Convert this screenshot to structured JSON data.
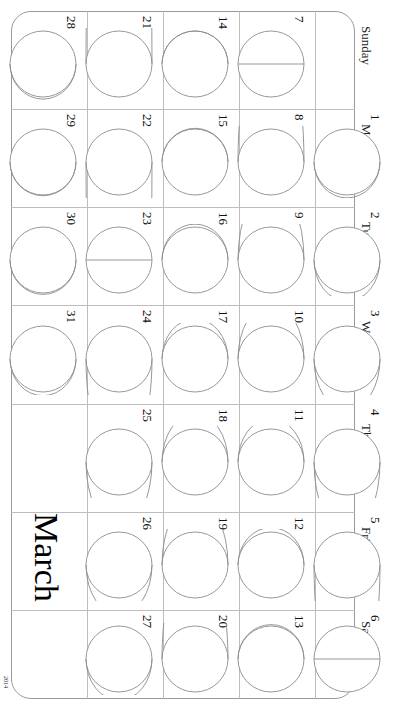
{
  "document": {
    "month_title": "March",
    "page_mark": "2014",
    "orientation_degrees": 90,
    "border_color": "#9a9a9a",
    "grid_color": "#bdbdbd",
    "moon_stroke_color": "#8c8c8c",
    "text_color": "#111111"
  },
  "weekdays": [
    {
      "label": "Sunday"
    },
    {
      "label": "Monday"
    },
    {
      "label": "Tuesday"
    },
    {
      "label": "Wednesday"
    },
    {
      "label": "Thursday"
    },
    {
      "label": "Friday"
    },
    {
      "label": "Saturday"
    }
  ],
  "weeks": [
    {
      "index": 0
    },
    {
      "index": 1
    },
    {
      "index": 2
    },
    {
      "index": 3
    },
    {
      "index": 4
    }
  ],
  "days": [
    {
      "day": "1",
      "weekday": "Monday",
      "week": 4,
      "phase": "waxing-crescent",
      "illumination": 0.04
    },
    {
      "day": "2",
      "weekday": "Tuesday",
      "week": 4,
      "phase": "waxing-crescent",
      "illumination": 0.1
    },
    {
      "day": "3",
      "weekday": "Wednesday",
      "week": 4,
      "phase": "waxing-crescent",
      "illumination": 0.18
    },
    {
      "day": "4",
      "weekday": "Thursday",
      "week": 4,
      "phase": "waxing-crescent",
      "illumination": 0.27
    },
    {
      "day": "5",
      "weekday": "Friday",
      "week": 4,
      "phase": "first-quarter",
      "illumination": 0.38
    },
    {
      "day": "6",
      "weekday": "Saturday",
      "week": 4,
      "phase": "first-quarter",
      "illumination": 0.48
    },
    {
      "day": "7",
      "weekday": "Sunday",
      "week": 3,
      "phase": "first-quarter",
      "illumination": 0.5
    },
    {
      "day": "8",
      "weekday": "Monday",
      "week": 3,
      "phase": "waxing-gibbous",
      "illumination": 0.62
    },
    {
      "day": "9",
      "weekday": "Tuesday",
      "week": 3,
      "phase": "waxing-gibbous",
      "illumination": 0.72
    },
    {
      "day": "10",
      "weekday": "Wednesday",
      "week": 3,
      "phase": "waxing-gibbous",
      "illumination": 0.8
    },
    {
      "day": "11",
      "weekday": "Thursday",
      "week": 3,
      "phase": "waxing-gibbous",
      "illumination": 0.88
    },
    {
      "day": "12",
      "weekday": "Friday",
      "week": 3,
      "phase": "waxing-gibbous",
      "illumination": 0.94
    },
    {
      "day": "13",
      "weekday": "Saturday",
      "week": 3,
      "phase": "waxing-gibbous",
      "illumination": 0.98
    },
    {
      "day": "14",
      "weekday": "Sunday",
      "week": 2,
      "phase": "full-moon",
      "illumination": 1.0
    },
    {
      "day": "15",
      "weekday": "Monday",
      "week": 2,
      "phase": "full-moon",
      "illumination": 0.99
    },
    {
      "day": "16",
      "weekday": "Tuesday",
      "week": 2,
      "phase": "waning-gibbous",
      "illumination": 0.96
    },
    {
      "day": "17",
      "weekday": "Wednesday",
      "week": 2,
      "phase": "waning-gibbous",
      "illumination": 0.91
    },
    {
      "day": "18",
      "weekday": "Thursday",
      "week": 2,
      "phase": "waning-gibbous",
      "illumination": 0.84
    },
    {
      "day": "19",
      "weekday": "Friday",
      "week": 2,
      "phase": "waning-gibbous",
      "illumination": 0.75
    },
    {
      "day": "20",
      "weekday": "Saturday",
      "week": 2,
      "phase": "waning-gibbous",
      "illumination": 0.65
    },
    {
      "day": "21",
      "weekday": "Sunday",
      "week": 1,
      "phase": "last-quarter",
      "illumination": 0.55
    },
    {
      "day": "22",
      "weekday": "Monday",
      "week": 1,
      "phase": "last-quarter",
      "illumination": 0.45
    },
    {
      "day": "23",
      "weekday": "Tuesday",
      "week": 1,
      "phase": "last-quarter",
      "illumination": 0.5
    },
    {
      "day": "24",
      "weekday": "Wednesday",
      "week": 1,
      "phase": "waning-crescent",
      "illumination": 0.34
    },
    {
      "day": "25",
      "weekday": "Thursday",
      "week": 1,
      "phase": "waning-crescent",
      "illumination": 0.25
    },
    {
      "day": "26",
      "weekday": "Friday",
      "week": 1,
      "phase": "waning-crescent",
      "illumination": 0.17
    },
    {
      "day": "27",
      "weekday": "Saturday",
      "week": 1,
      "phase": "waning-crescent",
      "illumination": 0.1
    },
    {
      "day": "28",
      "weekday": "Sunday",
      "week": 0,
      "phase": "new-moon",
      "illumination": 0.03
    },
    {
      "day": "29",
      "weekday": "Monday",
      "week": 0,
      "phase": "new-moon",
      "illumination": 0.01
    },
    {
      "day": "30",
      "weekday": "Tuesday",
      "week": 0,
      "phase": "new-moon",
      "illumination": 0.02
    },
    {
      "day": "31",
      "weekday": "Wednesday",
      "week": 0,
      "phase": "waxing-crescent",
      "illumination": 0.05
    }
  ],
  "empty_cells": [
    {
      "weekday": "Sunday",
      "week": 4,
      "content": ""
    },
    {
      "weekday": "Thursday",
      "week": 0,
      "content": ""
    },
    {
      "weekday": "Friday",
      "week": 0,
      "content": "March"
    },
    {
      "weekday": "Saturday",
      "week": 0,
      "content": ""
    }
  ]
}
